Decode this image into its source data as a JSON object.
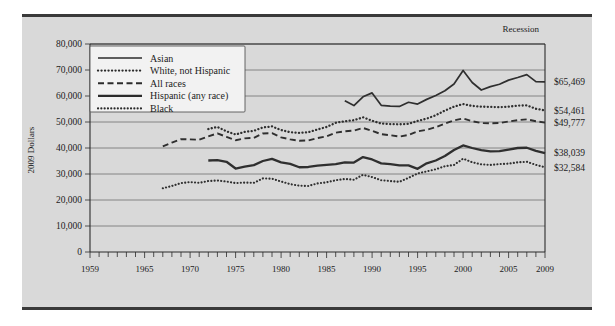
{
  "figure": {
    "background_color": "#d9d9d9",
    "frame_color": "#3a3a3a",
    "annotation_recession": "Recession"
  },
  "chart_data": {
    "type": "line",
    "title": "",
    "subtitle": "",
    "xlabel": "",
    "ylabel": "2009 Dollars",
    "xlim": [
      1959,
      2009
    ],
    "ylim": [
      0,
      80000
    ],
    "grid": true,
    "legend_position": "top-left",
    "ytick_labels": [
      "0",
      "10,000",
      "20,000",
      "30,000",
      "40,000",
      "50,000",
      "60,000",
      "70,000",
      "80,000"
    ],
    "ytick_values": [
      0,
      10000,
      20000,
      30000,
      40000,
      50000,
      60000,
      70000,
      80000
    ],
    "xtick_labels": [
      "1959",
      "1965",
      "1970",
      "1975",
      "1980",
      "1985",
      "1990",
      "1995",
      "2000",
      "2005",
      "2009"
    ],
    "xtick_values": [
      1959,
      1965,
      1970,
      1975,
      1980,
      1985,
      1990,
      1995,
      2000,
      2005,
      2009
    ],
    "minor_xticks_every": 1,
    "end_labels": [
      {
        "series": "Asian",
        "text": "$65,469",
        "value": 65469
      },
      {
        "series": "White, not Hispanic",
        "text": "$54,461",
        "value": 54461
      },
      {
        "series": "All races",
        "text": "$49,777",
        "value": 49777
      },
      {
        "series": "Hispanic (any race)",
        "text": "$38,039",
        "value": 38039
      },
      {
        "series": "Black",
        "text": "$32,584",
        "value": 32584
      }
    ],
    "series": [
      {
        "name": "Asian",
        "style": "solid-thin",
        "color": "#3a3a3a",
        "x": [
          1987,
          1988,
          1989,
          1990,
          1991,
          1992,
          1993,
          1994,
          1995,
          1996,
          1997,
          1998,
          1999,
          2000,
          2001,
          2002,
          2003,
          2004,
          2005,
          2006,
          2007,
          2008,
          2009
        ],
        "values": [
          58200,
          56300,
          59700,
          61200,
          56400,
          56100,
          56000,
          57600,
          56900,
          58700,
          60200,
          62000,
          64600,
          69800,
          65200,
          62300,
          63600,
          64500,
          66100,
          67100,
          68200,
          65500,
          65469
        ]
      },
      {
        "name": "White, not Hispanic",
        "style": "dotted",
        "color": "#2b2b2b",
        "x": [
          1972,
          1973,
          1974,
          1975,
          1976,
          1977,
          1978,
          1979,
          1980,
          1981,
          1982,
          1983,
          1984,
          1985,
          1986,
          1987,
          1988,
          1989,
          1990,
          1991,
          1992,
          1993,
          1994,
          1995,
          1996,
          1997,
          1998,
          1999,
          2000,
          2001,
          2002,
          2003,
          2004,
          2005,
          2006,
          2007,
          2008,
          2009
        ],
        "values": [
          47300,
          48100,
          46400,
          45200,
          46200,
          46600,
          47900,
          48300,
          46900,
          46100,
          45800,
          46100,
          47100,
          48100,
          49700,
          50300,
          50700,
          51800,
          50500,
          49400,
          49200,
          49100,
          49300,
          50400,
          51300,
          52600,
          54400,
          55900,
          56900,
          56200,
          55900,
          55800,
          55700,
          55900,
          56300,
          56400,
          55100,
          54461
        ]
      },
      {
        "name": "All races",
        "style": "dashed",
        "color": "#5a5a5a",
        "x": [
          1967,
          1968,
          1969,
          1970,
          1971,
          1972,
          1973,
          1974,
          1975,
          1976,
          1977,
          1978,
          1979,
          1980,
          1981,
          1982,
          1983,
          1984,
          1985,
          1986,
          1987,
          1988,
          1989,
          1990,
          1991,
          1992,
          1993,
          1994,
          1995,
          1996,
          1997,
          1998,
          1999,
          2000,
          2001,
          2002,
          2003,
          2004,
          2005,
          2006,
          2007,
          2008,
          2009
        ],
        "values": [
          40600,
          42100,
          43400,
          43300,
          43200,
          44500,
          45600,
          44300,
          43000,
          43700,
          43900,
          45600,
          45700,
          44100,
          43300,
          42800,
          42900,
          43800,
          44500,
          45900,
          46400,
          46700,
          47700,
          46600,
          45300,
          44900,
          44400,
          45000,
          46400,
          47000,
          48000,
          49400,
          50600,
          51400,
          50300,
          49600,
          49500,
          49600,
          50200,
          50700,
          51000,
          50300,
          49777
        ]
      },
      {
        "name": "Hispanic (any race)",
        "style": "solid-thick",
        "color": "#1c1c1c",
        "x": [
          1972,
          1973,
          1974,
          1975,
          1976,
          1977,
          1978,
          1979,
          1980,
          1981,
          1982,
          1983,
          1984,
          1985,
          1986,
          1987,
          1988,
          1989,
          1990,
          1991,
          1992,
          1993,
          1994,
          1995,
          1996,
          1997,
          1998,
          1999,
          2000,
          2001,
          2002,
          2003,
          2004,
          2005,
          2006,
          2007,
          2008,
          2009
        ],
        "values": [
          35200,
          35300,
          34700,
          32100,
          32800,
          33400,
          35000,
          35800,
          34500,
          33900,
          32600,
          32700,
          33200,
          33500,
          33800,
          34500,
          34400,
          36500,
          35600,
          34100,
          33800,
          33300,
          33300,
          32000,
          34100,
          35200,
          36900,
          39200,
          41000,
          40000,
          39200,
          38700,
          38800,
          39400,
          40000,
          40100,
          38900,
          38039
        ]
      },
      {
        "name": "Black",
        "style": "dotted-fine",
        "color": "#2b2b2b",
        "x": [
          1967,
          1968,
          1969,
          1970,
          1971,
          1972,
          1973,
          1974,
          1975,
          1976,
          1977,
          1978,
          1979,
          1980,
          1981,
          1982,
          1983,
          1984,
          1985,
          1986,
          1987,
          1988,
          1989,
          1990,
          1991,
          1992,
          1993,
          1994,
          1995,
          1996,
          1997,
          1998,
          1999,
          2000,
          2001,
          2002,
          2003,
          2004,
          2005,
          2006,
          2007,
          2008,
          2009
        ],
        "values": [
          24500,
          25400,
          26500,
          26900,
          26600,
          27300,
          27500,
          27100,
          26500,
          26700,
          26600,
          28300,
          28200,
          27100,
          26100,
          25500,
          25400,
          26400,
          26800,
          27600,
          28100,
          27800,
          29700,
          28800,
          27600,
          27300,
          27000,
          28500,
          30200,
          31000,
          31800,
          33000,
          33500,
          35900,
          34500,
          33700,
          33500,
          33800,
          34000,
          34500,
          34700,
          33500,
          32584
        ]
      }
    ]
  },
  "legend": {
    "items": [
      {
        "label": "Asian",
        "style": "solid-thin"
      },
      {
        "label": "White, not Hispanic",
        "style": "dotted"
      },
      {
        "label": "All races",
        "style": "dashed"
      },
      {
        "label": "Hispanic (any race)",
        "style": "solid-thick"
      },
      {
        "label": "Black",
        "style": "dotted-fine"
      }
    ]
  }
}
